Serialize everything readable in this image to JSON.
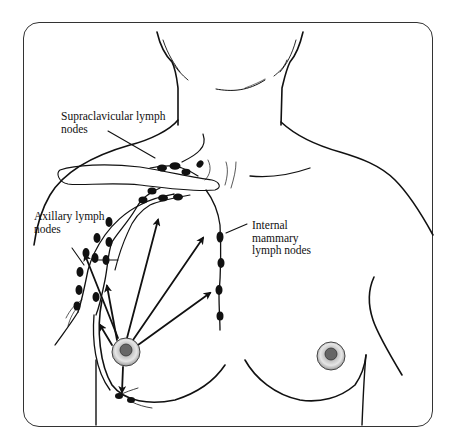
{
  "diagram": {
    "labels": {
      "supraclavicular": "Supraclavicular lymph\nnodes",
      "axillary": "Axillary lymph\nnodes",
      "internal_mammary": "Internal\nmammary\nlymph nodes"
    },
    "colors": {
      "line": "#111111",
      "frame": "#333333",
      "background": "#ffffff"
    }
  }
}
